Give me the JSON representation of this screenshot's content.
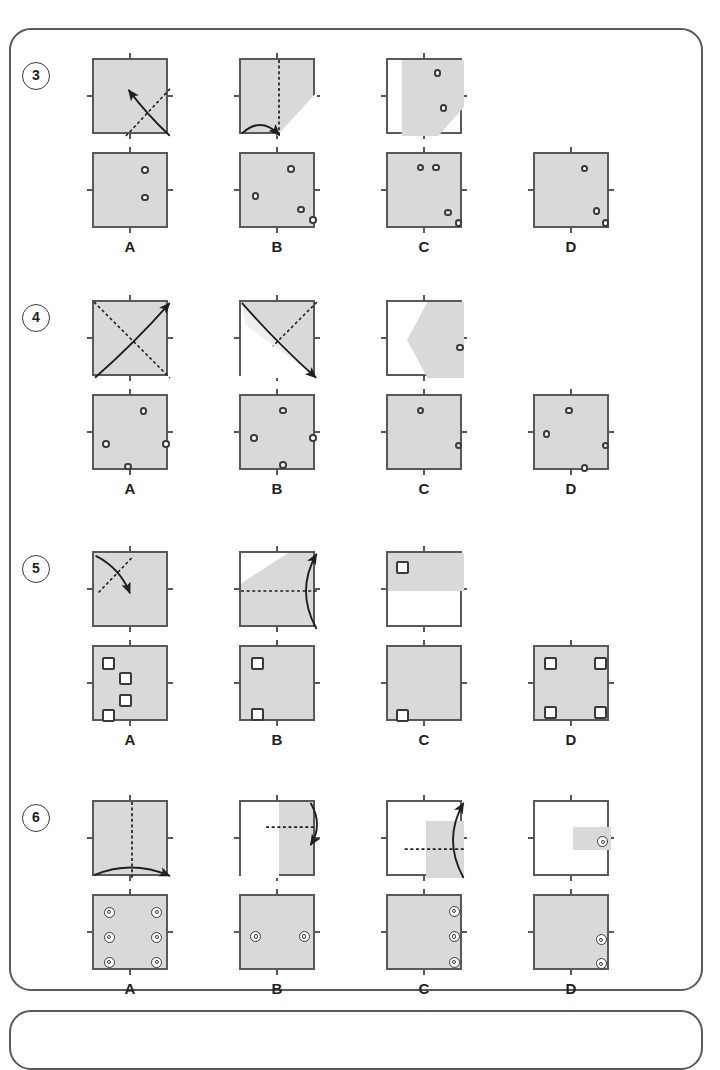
{
  "page": {
    "background": "#ffffff",
    "frame_border": "#58595b",
    "paper_fill": "#d9d9d9",
    "paper_light_fill": "#e3e3e3",
    "ink": "#231f20"
  },
  "option_labels": [
    "A",
    "B",
    "C",
    "D"
  ],
  "rows": [
    {
      "number": "3",
      "mark_type": "circle",
      "options": [
        {
          "label": "A",
          "has_fold_panel": true,
          "fold": {
            "fill": "gray",
            "crease": "diagonal-bl-tr",
            "arrow": "curve-br-to-center"
          },
          "answer_marks": [
            {
              "x": 0.62,
              "y": 0.16
            },
            {
              "x": 0.62,
              "y": 0.52
            }
          ]
        },
        {
          "label": "B",
          "has_fold_panel": true,
          "fold": {
            "fill": "gray",
            "crease": "vertical-center",
            "arrow": "curve-bottom-left-to-center",
            "corner_shade": "bottom-right-triangle"
          },
          "answer_marks": [
            {
              "x": 0.61,
              "y": 0.15
            },
            {
              "x": 0.14,
              "y": 0.5
            },
            {
              "x": 0.74,
              "y": 0.68
            },
            {
              "x": 0.9,
              "y": 0.82
            }
          ]
        },
        {
          "label": "C",
          "has_fold_panel": true,
          "fold": {
            "fill": "white",
            "shade": "left-strip-and-wedge",
            "marks": [
              {
                "x": 0.6,
                "y": 0.12
              },
              {
                "x": 0.68,
                "y": 0.58
              }
            ]
          },
          "answer_marks": [
            {
              "x": 0.38,
              "y": 0.13
            },
            {
              "x": 0.58,
              "y": 0.13
            },
            {
              "x": 0.74,
              "y": 0.72
            },
            {
              "x": 0.88,
              "y": 0.86
            }
          ]
        },
        {
          "label": "D",
          "has_fold_panel": false,
          "answer_marks": [
            {
              "x": 0.6,
              "y": 0.14
            },
            {
              "x": 0.76,
              "y": 0.7
            },
            {
              "x": 0.88,
              "y": 0.86
            }
          ]
        }
      ]
    },
    {
      "number": "4",
      "mark_type": "circle",
      "options": [
        {
          "label": "A",
          "has_fold_panel": true,
          "fold": {
            "fill": "gray",
            "crease": "diagonal-tl-br",
            "arrow": "curve-bl-to-tr"
          },
          "answer_marks": [
            {
              "x": 0.6,
              "y": 0.15
            },
            {
              "x": 0.11,
              "y": 0.58
            },
            {
              "x": 0.9,
              "y": 0.58
            },
            {
              "x": 0.4,
              "y": 0.88
            }
          ]
        },
        {
          "label": "B",
          "has_fold_panel": true,
          "fold": {
            "fill": "half-diagonal-upper-right",
            "crease": "diagonal-tr-center",
            "arrow": "curve-tl-to-br"
          },
          "answer_marks": [
            {
              "x": 0.5,
              "y": 0.14
            },
            {
              "x": 0.12,
              "y": 0.5
            },
            {
              "x": 0.9,
              "y": 0.5
            },
            {
              "x": 0.5,
              "y": 0.86
            }
          ]
        },
        {
          "label": "C",
          "has_fold_panel": true,
          "fold": {
            "fill": "white",
            "shade": "right-wedge-pointing-left",
            "marks": [
              {
                "x": 0.9,
                "y": 0.55
              }
            ]
          },
          "answer_marks": [
            {
              "x": 0.38,
              "y": 0.14
            },
            {
              "x": 0.88,
              "y": 0.6
            }
          ]
        },
        {
          "label": "D",
          "has_fold_panel": false,
          "answer_marks": [
            {
              "x": 0.4,
              "y": 0.14
            },
            {
              "x": 0.1,
              "y": 0.45
            },
            {
              "x": 0.88,
              "y": 0.6
            },
            {
              "x": 0.6,
              "y": 0.9
            }
          ]
        }
      ]
    },
    {
      "number": "5",
      "mark_type": "square",
      "options": [
        {
          "label": "A",
          "has_fold_panel": true,
          "fold": {
            "fill": "gray",
            "crease": "diagonal-bl-tr-short",
            "arrow": "curve-tl-to-center"
          },
          "answer_marks": [
            {
              "x": 0.11,
              "y": 0.13
            },
            {
              "x": 0.33,
              "y": 0.33
            },
            {
              "x": 0.33,
              "y": 0.62
            },
            {
              "x": 0.11,
              "y": 0.82
            }
          ]
        },
        {
          "label": "B",
          "has_fold_panel": true,
          "fold": {
            "fill": "gray-with-white-tl-triangle",
            "crease": "horizontal-center",
            "arrow": "curve-right-bottom-to-top"
          },
          "answer_marks": [
            {
              "x": 0.13,
              "y": 0.13
            },
            {
              "x": 0.13,
              "y": 0.8
            }
          ]
        },
        {
          "label": "C",
          "has_fold_panel": true,
          "fold": {
            "fill": "white",
            "shade": "top-half",
            "marks": [
              {
                "x": 0.1,
                "y": 0.1
              }
            ]
          },
          "answer_marks": [
            {
              "x": 0.11,
              "y": 0.82
            }
          ]
        },
        {
          "label": "D",
          "has_fold_panel": false,
          "answer_marks": [
            {
              "x": 0.12,
              "y": 0.13
            },
            {
              "x": 0.78,
              "y": 0.13
            },
            {
              "x": 0.12,
              "y": 0.78
            },
            {
              "x": 0.78,
              "y": 0.78
            }
          ]
        }
      ]
    },
    {
      "number": "6",
      "mark_type": "ring",
      "options": [
        {
          "label": "A",
          "has_fold_panel": true,
          "fold": {
            "fill": "gray",
            "crease": "vertical-center",
            "arrow": "curve-bottom-left-to-right"
          },
          "answer_marks": [
            {
              "x": 0.13,
              "y": 0.14
            },
            {
              "x": 0.75,
              "y": 0.14
            },
            {
              "x": 0.13,
              "y": 0.47
            },
            {
              "x": 0.75,
              "y": 0.47
            },
            {
              "x": 0.13,
              "y": 0.8
            },
            {
              "x": 0.75,
              "y": 0.8
            }
          ]
        },
        {
          "label": "B",
          "has_fold_panel": true,
          "fold": {
            "fill": "right-half-gray",
            "crease": "horizontal-right",
            "arrow": "curve-right-top-to-bottom"
          },
          "answer_marks": [
            {
              "x": 0.12,
              "y": 0.46
            },
            {
              "x": 0.76,
              "y": 0.46
            }
          ]
        },
        {
          "label": "C",
          "has_fold_panel": true,
          "fold": {
            "fill": "white",
            "shade": "right-quarter-block",
            "crease": "horizontal-right-short",
            "arrow": "curve-right-bottom-to-top"
          },
          "answer_marks": [
            {
              "x": 0.8,
              "y": 0.13
            },
            {
              "x": 0.8,
              "y": 0.46
            },
            {
              "x": 0.8,
              "y": 0.8
            }
          ]
        },
        {
          "label": "D",
          "has_fold_panel": true,
          "fold": {
            "fill": "white",
            "shade": "small-right-block",
            "marks": [
              {
                "x": 0.82,
                "y": 0.45
              }
            ]
          },
          "answer_marks": [
            {
              "x": 0.8,
              "y": 0.5
            },
            {
              "x": 0.8,
              "y": 0.82
            }
          ]
        }
      ]
    }
  ]
}
